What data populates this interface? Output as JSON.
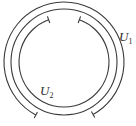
{
  "diagram": {
    "stroke_color": "#3a3a3a",
    "center": [
      64,
      62
    ],
    "circle": {
      "radius": 53
    },
    "cover_sets": [
      {
        "name": "U1",
        "label_main": "U",
        "label_sub": "1",
        "radius": 60,
        "gap_start_deg": 61,
        "gap_end_deg": 118,
        "gap_location": "bottom",
        "label_pos": [
          119,
          30
        ]
      },
      {
        "name": "U2",
        "label_main": "U",
        "label_sub": "2",
        "radius": 45,
        "gap_start_deg": 250,
        "gap_end_deg": 290,
        "gap_location": "top",
        "label_pos": [
          40,
          84
        ]
      }
    ]
  }
}
